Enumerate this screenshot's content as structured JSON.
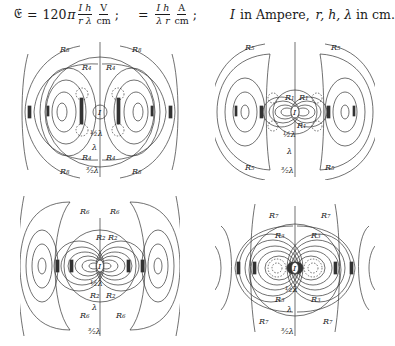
{
  "formulas": {
    "E": {
      "symbol": "𝔈",
      "equals": "=",
      "coef": "120",
      "pi": "π",
      "num": "I h",
      "den": "r λ",
      "unit_num": "V",
      "unit_den": "cm",
      "sep": ";"
    },
    "H": {
      "symbol": "𝔋",
      "equals": "=",
      "num": "I h",
      "den": "λ r",
      "unit_num": "A",
      "unit_den": "cm",
      "sep": ";"
    },
    "units": {
      "I_text": "I",
      "in_ampere": "in Ampere,",
      "vars": "r, h, λ",
      "in_cm": "in cm."
    }
  },
  "figures": [
    {
      "id": "top-left",
      "region_inner": "R",
      "inner_sub": "4",
      "region_outer": "R",
      "outer_sub": "8",
      "axis_marks": [
        "½λ",
        "λ",
        "3/2λ"
      ],
      "center_label": "I"
    },
    {
      "id": "top-right",
      "region_inner": "R",
      "inner_sub": "1",
      "region_outer": "R",
      "outer_sub": "5",
      "axis_marks": [
        "½λ",
        "λ",
        "3/2λ"
      ],
      "center_label": "I"
    },
    {
      "id": "bottom-left",
      "region_inner": "R",
      "inner_sub": "2",
      "region_outer": "R",
      "outer_sub": "6",
      "axis_marks": [
        "½λ",
        "λ",
        "3/2λ"
      ],
      "center_label": "I"
    },
    {
      "id": "bottom-right",
      "region_inner": "R",
      "inner_sub": "3",
      "region_outer": "R",
      "outer_sub": "7",
      "axis_marks": [
        "½λ",
        "λ",
        "3/2λ"
      ],
      "center_label": "I"
    }
  ]
}
